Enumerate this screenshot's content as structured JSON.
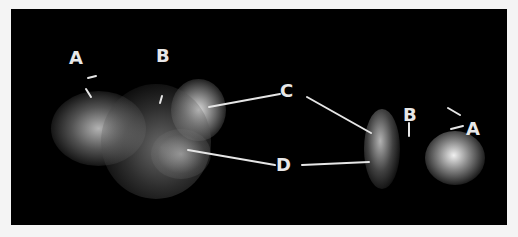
{
  "figure": {
    "background_color": "#000000",
    "frame_color": "#f4f4f4",
    "label_color": "#e8e8e8",
    "labels": [
      {
        "id": "label-a-left",
        "text": "A",
        "x": 58,
        "y": 40
      },
      {
        "id": "label-b-left",
        "text": "B",
        "x": 145,
        "y": 38
      },
      {
        "id": "label-c",
        "text": "C",
        "x": 269,
        "y": 73
      },
      {
        "id": "label-d",
        "text": "D",
        "x": 265,
        "y": 147
      },
      {
        "id": "label-b-right",
        "text": "B",
        "x": 392,
        "y": 97
      },
      {
        "id": "label-a-right",
        "text": "A",
        "x": 455,
        "y": 111
      }
    ]
  }
}
